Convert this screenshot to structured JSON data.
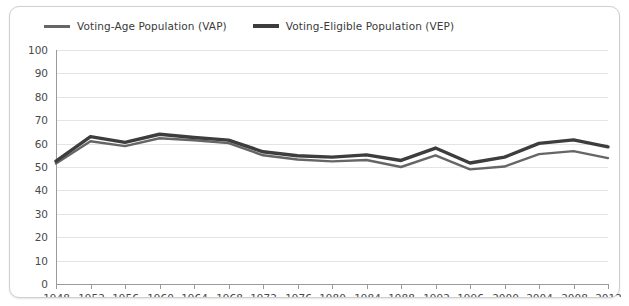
{
  "legend": {
    "position": "top-left",
    "entries": [
      {
        "label": "Voting-Age Population (VAP)",
        "color": "#666666",
        "width": 3
      },
      {
        "label": "Voting-Eligible Population (VEP)",
        "color": "#3d3d3d",
        "width": 4
      }
    ]
  },
  "axes": {
    "y_ticks": [
      "0",
      "10",
      "20",
      "30",
      "40",
      "50",
      "60",
      "70",
      "80",
      "90",
      "100"
    ],
    "x_ticks": [
      "1948",
      "1952",
      "1956",
      "1960",
      "1964",
      "1968",
      "1972",
      "1976",
      "1980",
      "1984",
      "1988",
      "1992",
      "1996",
      "2000",
      "2004",
      "2008",
      "2012"
    ]
  },
  "colors": {
    "grid": "#e4e4e4",
    "axis": "#9a9a9a",
    "card_border": "#cfcfcf",
    "background": "#ffffff",
    "tick_text": "#4a4a4a"
  },
  "chart_data": {
    "type": "line",
    "title": "",
    "subtitle": "",
    "xlabel": "",
    "ylabel": "",
    "xlim": [
      1948,
      2012
    ],
    "ylim": [
      0,
      100
    ],
    "grid": true,
    "legend_position": "top-left",
    "x": [
      1948,
      1952,
      1956,
      1960,
      1964,
      1968,
      1972,
      1976,
      1980,
      1984,
      1988,
      1992,
      1996,
      2000,
      2004,
      2008,
      2012
    ],
    "categories": [
      "1948",
      "1952",
      "1956",
      "1960",
      "1964",
      "1968",
      "1972",
      "1976",
      "1980",
      "1984",
      "1988",
      "1992",
      "1996",
      "2000",
      "2004",
      "2008",
      "2012"
    ],
    "series": [
      {
        "name": "Voting-Age Population (VAP)",
        "color": "#666666",
        "values": [
          51.5,
          61.0,
          58.9,
          62.3,
          61.4,
          60.2,
          55.0,
          53.2,
          52.4,
          53.0,
          50.0,
          55.0,
          49.0,
          50.2,
          55.5,
          56.8,
          53.8
        ]
      },
      {
        "name": "Voting-Eligible Population (VEP)",
        "color": "#3d3d3d",
        "values": [
          52.5,
          63.0,
          60.5,
          64.0,
          62.6,
          61.5,
          56.5,
          54.8,
          54.2,
          55.2,
          52.8,
          58.1,
          51.7,
          54.2,
          60.1,
          61.6,
          58.6
        ]
      }
    ]
  }
}
